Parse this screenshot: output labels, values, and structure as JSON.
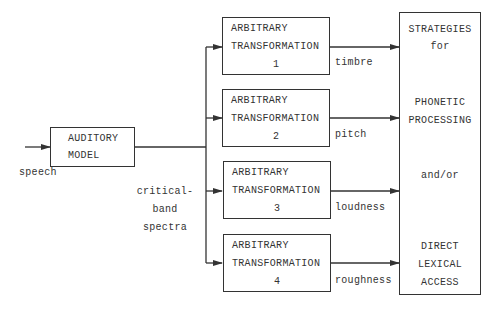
{
  "diagram": {
    "input": {
      "label": "speech"
    },
    "auditory_model": {
      "line1": "AUDITORY",
      "line2": "MODEL"
    },
    "bus_label": {
      "line1": "critical-",
      "line2": "band",
      "line3": "spectra"
    },
    "transformations": [
      {
        "line1": "ARBITRARY",
        "line2": "TRANSFORMATION",
        "number": "1",
        "output": "timbre"
      },
      {
        "line1": "ARBITRARY",
        "line2": "TRANSFORMATION",
        "number": "2",
        "output": "pitch"
      },
      {
        "line1": "ARBITRARY",
        "line2": "TRANSFORMATION",
        "number": "3",
        "output": "loudness"
      },
      {
        "line1": "ARBITRARY",
        "line2": "TRANSFORMATION",
        "number": "4",
        "output": "roughness"
      }
    ],
    "strategies": {
      "lines": [
        "STRATEGIES",
        "for",
        "PHONETIC",
        "PROCESSING",
        "and/or",
        "DIRECT",
        "LEXICAL",
        "ACCESS"
      ]
    },
    "colors": {
      "stroke": "#333333",
      "background": "#ffffff"
    }
  }
}
